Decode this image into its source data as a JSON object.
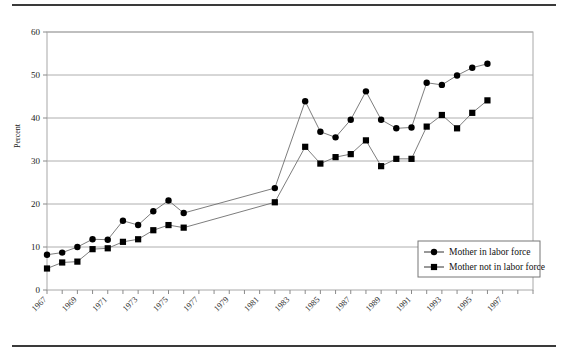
{
  "figure": {
    "ylabel": "Percent",
    "rule_color": "#3a3a3a"
  },
  "legend": {
    "position": "bottom-right",
    "entries": [
      {
        "label": "Mother in labor force",
        "marker": "circle-marker-icon",
        "color": "#000000"
      },
      {
        "label": "Mother not in labor force",
        "marker": "square-marker-icon",
        "color": "#000000"
      }
    ]
  },
  "chart_data": {
    "type": "line",
    "title": "",
    "xlabel": "",
    "ylabel": "Percent",
    "ylim": [
      0,
      60
    ],
    "yticks": [
      0,
      10,
      20,
      30,
      40,
      50,
      60
    ],
    "grid": true,
    "legend_position": "bottom-right",
    "x": [
      1967,
      1968,
      1969,
      1970,
      1971,
      1972,
      1973,
      1974,
      1975,
      1976,
      1977,
      1983,
      1985,
      1986,
      1987,
      1988,
      1989,
      1990,
      1991,
      1992,
      1993,
      1994,
      1995,
      1996,
      1997,
      1998
    ],
    "xtick_labels": [
      "1967",
      "1969",
      "1971",
      "1973",
      "1975",
      "1977",
      "1979",
      "1981",
      "1983",
      "1985",
      "1987",
      "1989",
      "1991",
      "1993",
      "1995",
      "1997"
    ],
    "xlim": [
      1967,
      1999
    ],
    "series": [
      {
        "name": "Mother in labor force",
        "marker": "circle",
        "values": [
          8.2,
          8.7,
          10.0,
          11.8,
          11.7,
          16.1,
          15.1,
          18.3,
          20.8,
          17.9,
          null,
          23.7,
          43.9,
          36.8,
          35.5,
          39.6,
          46.2,
          39.6,
          37.6,
          37.8,
          48.2,
          47.7,
          49.9,
          51.7,
          52.6,
          null
        ]
      },
      {
        "name": "Mother not in labor force",
        "marker": "square",
        "values": [
          5.0,
          6.4,
          6.6,
          9.5,
          9.7,
          11.2,
          11.8,
          13.9,
          15.1,
          14.5,
          null,
          20.4,
          33.3,
          29.4,
          30.9,
          31.6,
          34.8,
          28.8,
          30.5,
          30.5,
          38.0,
          40.7,
          37.6,
          41.2,
          44.1,
          null
        ]
      }
    ],
    "series_points": {
      "mother_in_labor_force": [
        {
          "year": 1967,
          "value": 8.2
        },
        {
          "year": 1968,
          "value": 8.7
        },
        {
          "year": 1969,
          "value": 10.0
        },
        {
          "year": 1970,
          "value": 11.8
        },
        {
          "year": 1971,
          "value": 11.7
        },
        {
          "year": 1972,
          "value": 16.1
        },
        {
          "year": 1973,
          "value": 15.1
        },
        {
          "year": 1974,
          "value": 18.3
        },
        {
          "year": 1975,
          "value": 20.8
        },
        {
          "year": 1976,
          "value": 17.9
        },
        {
          "year": 1982,
          "value": 23.7
        },
        {
          "year": 1984,
          "value": 43.9
        },
        {
          "year": 1985,
          "value": 36.8
        },
        {
          "year": 1986,
          "value": 35.5
        },
        {
          "year": 1987,
          "value": 39.6
        },
        {
          "year": 1988,
          "value": 46.2
        },
        {
          "year": 1989,
          "value": 39.6
        },
        {
          "year": 1990,
          "value": 37.6
        },
        {
          "year": 1991,
          "value": 37.8
        },
        {
          "year": 1992,
          "value": 48.2
        },
        {
          "year": 1993,
          "value": 47.7
        },
        {
          "year": 1994,
          "value": 49.9
        },
        {
          "year": 1995,
          "value": 51.7
        },
        {
          "year": 1996,
          "value": 52.6
        }
      ],
      "mother_not_in_labor_force": [
        {
          "year": 1967,
          "value": 5.0
        },
        {
          "year": 1968,
          "value": 6.4
        },
        {
          "year": 1969,
          "value": 6.6
        },
        {
          "year": 1970,
          "value": 9.5
        },
        {
          "year": 1971,
          "value": 9.7
        },
        {
          "year": 1972,
          "value": 11.2
        },
        {
          "year": 1973,
          "value": 11.8
        },
        {
          "year": 1974,
          "value": 13.9
        },
        {
          "year": 1975,
          "value": 15.1
        },
        {
          "year": 1976,
          "value": 14.5
        },
        {
          "year": 1982,
          "value": 20.4
        },
        {
          "year": 1984,
          "value": 33.3
        },
        {
          "year": 1985,
          "value": 29.4
        },
        {
          "year": 1986,
          "value": 30.9
        },
        {
          "year": 1987,
          "value": 31.6
        },
        {
          "year": 1988,
          "value": 34.8
        },
        {
          "year": 1989,
          "value": 28.8
        },
        {
          "year": 1990,
          "value": 30.5
        },
        {
          "year": 1991,
          "value": 30.5
        },
        {
          "year": 1992,
          "value": 38.0
        },
        {
          "year": 1993,
          "value": 40.7
        },
        {
          "year": 1994,
          "value": 37.6
        },
        {
          "year": 1995,
          "value": 41.2
        },
        {
          "year": 1996,
          "value": 44.1
        }
      ]
    }
  }
}
